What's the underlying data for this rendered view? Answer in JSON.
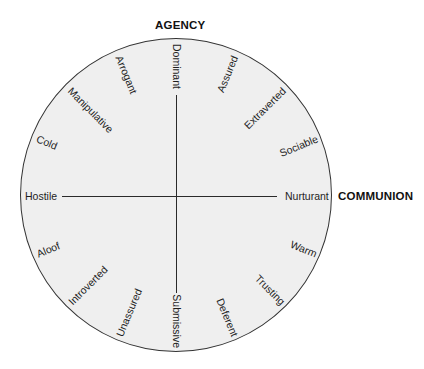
{
  "axes": {
    "vertical_title": "AGENCY",
    "horizontal_title": "COMMUNION"
  },
  "circle": {
    "center_x": 177,
    "center_y": 196,
    "radius": 158
  },
  "traits": [
    {
      "label": "Nurturant",
      "angle": 0,
      "side": "right"
    },
    {
      "label": "Sociable",
      "angle": 22.5,
      "side": "right"
    },
    {
      "label": "Extraverted",
      "angle": 45,
      "side": "right"
    },
    {
      "label": "Assured",
      "angle": 67.5,
      "side": "right"
    },
    {
      "label": "Dominant",
      "angle": 90,
      "side": "left"
    },
    {
      "label": "Arrogant",
      "angle": 112.5,
      "side": "left"
    },
    {
      "label": "Manipulative",
      "angle": 135,
      "side": "left"
    },
    {
      "label": "Cold",
      "angle": 157.5,
      "side": "left"
    },
    {
      "label": "Hostile",
      "angle": 180,
      "side": "left"
    },
    {
      "label": "Aloof",
      "angle": 202.5,
      "side": "left"
    },
    {
      "label": "Introverted",
      "angle": 225,
      "side": "left"
    },
    {
      "label": "Unassured",
      "angle": 247.5,
      "side": "left"
    },
    {
      "label": "Submissive",
      "angle": 270,
      "side": "right"
    },
    {
      "label": "Deferent",
      "angle": 292.5,
      "side": "right"
    },
    {
      "label": "Trusting",
      "angle": 315,
      "side": "right"
    },
    {
      "label": "Warm",
      "angle": 337.5,
      "side": "right"
    }
  ]
}
